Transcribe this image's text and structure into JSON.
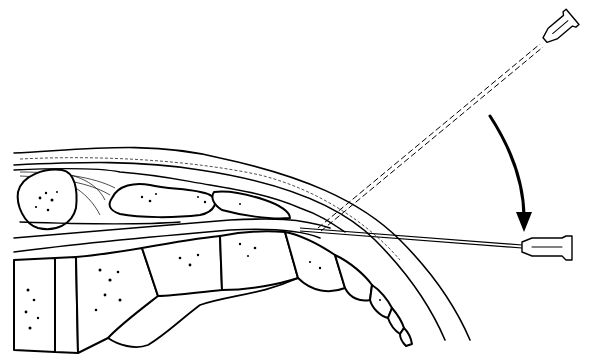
{
  "figure": {
    "colors": {
      "ink": "#000000",
      "background": "#ffffff"
    },
    "elements": [
      {
        "id": "needle-initial",
        "label": "Needle (initial angled position, dashed)",
        "style": "dashed"
      },
      {
        "id": "needle-final",
        "label": "Needle (final shallow position, solid)",
        "style": "solid"
      },
      {
        "id": "rotation-arrow",
        "label": "Curved arrow indicating rotation of needle downward"
      },
      {
        "id": "soft-tissue-layers",
        "label": "Superficial soft tissue / fat layer"
      },
      {
        "id": "bony-segments",
        "label": "Segmented bony structures"
      }
    ]
  }
}
